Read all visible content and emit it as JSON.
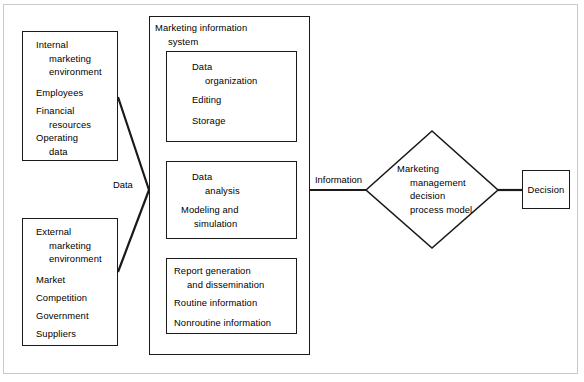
{
  "figure": {
    "line_color": "#1a1a1a",
    "frame_color": "#c9c9c9",
    "background": "#ffffff"
  },
  "inputs": {
    "internal": {
      "heading": "Internal\nmarketing\nenvironment",
      "items": [
        "Employees",
        "Financial\nresources",
        "Operating\ndata"
      ]
    },
    "external": {
      "heading": "External\nmarketing\nenvironment",
      "items": [
        "Market",
        "Competition",
        "Government",
        "Suppliers"
      ]
    }
  },
  "connectors": {
    "data_label": "Data",
    "information_label": "Information"
  },
  "mis": {
    "title": "Marketing information\nsystem",
    "stages": [
      {
        "heading": "Data\norganization",
        "items": [
          "Editing",
          "Storage"
        ]
      },
      {
        "heading": "Data\nanalysis",
        "items": [
          "Modeling and\nsimulation"
        ]
      },
      {
        "heading": "Report generation\nand dissemination",
        "items": [
          "Routine information",
          "Nonroutine information"
        ]
      }
    ]
  },
  "decision_model": {
    "label": "Marketing\nmanagement\ndecision\nprocess model"
  },
  "outcome": {
    "label": "Decision"
  }
}
